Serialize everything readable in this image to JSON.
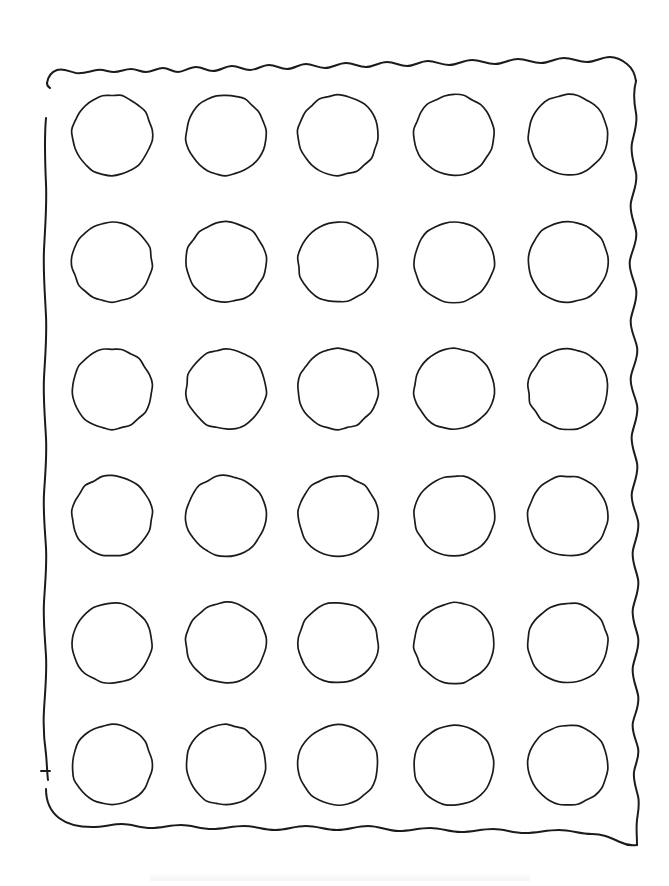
{
  "document": {
    "title": "Hand-drawn circle grid worksheet",
    "medium": "pencil-on-paper-scan",
    "page_width": 669,
    "page_height": 886,
    "background_color": "#ffffff",
    "ink_color": "#1b1b1b"
  },
  "border": {
    "label": "hand-drawn wavy rectangle frame",
    "stroke_color": "#1b1b1b",
    "stroke_width": 2.0,
    "bounds": {
      "left": 44,
      "top": 62,
      "right": 638,
      "bottom": 845
    },
    "style": "wobbly freehand outline with small scalloped bumps along top and bottom, gap near upper-left and mid-left"
  },
  "grid": {
    "label": "circle grid",
    "rows": 6,
    "columns": 5,
    "total_circles": 30,
    "circle_diameter": 80,
    "column_centers": [
      112,
      226,
      338,
      454,
      568
    ],
    "row_centers": [
      135,
      262,
      389,
      516,
      643,
      765
    ],
    "stroke_color": "#1b1b1b",
    "stroke_width": 1.7,
    "fill": "none"
  },
  "chart_data": {
    "type": "scatter",
    "xlabel": "",
    "ylabel": "",
    "categories": [
      "col 1",
      "col 2",
      "col 3",
      "col 4",
      "col 5"
    ],
    "rows": [
      "row 1",
      "row 2",
      "row 3",
      "row 4",
      "row 5",
      "row 6"
    ],
    "xlim": [
      44,
      638
    ],
    "ylim": [
      62,
      845
    ],
    "grid": false,
    "legend": "none",
    "points": [
      {
        "row": 1,
        "col": 1,
        "cx": 112,
        "cy": 135,
        "r": 40
      },
      {
        "row": 1,
        "col": 2,
        "cx": 226,
        "cy": 135,
        "r": 40
      },
      {
        "row": 1,
        "col": 3,
        "cx": 338,
        "cy": 135,
        "r": 40
      },
      {
        "row": 1,
        "col": 4,
        "cx": 454,
        "cy": 135,
        "r": 40
      },
      {
        "row": 1,
        "col": 5,
        "cx": 568,
        "cy": 135,
        "r": 40
      },
      {
        "row": 2,
        "col": 1,
        "cx": 112,
        "cy": 262,
        "r": 40
      },
      {
        "row": 2,
        "col": 2,
        "cx": 226,
        "cy": 262,
        "r": 40
      },
      {
        "row": 2,
        "col": 3,
        "cx": 338,
        "cy": 262,
        "r": 40
      },
      {
        "row": 2,
        "col": 4,
        "cx": 454,
        "cy": 262,
        "r": 40
      },
      {
        "row": 2,
        "col": 5,
        "cx": 568,
        "cy": 262,
        "r": 40
      },
      {
        "row": 3,
        "col": 1,
        "cx": 112,
        "cy": 389,
        "r": 40
      },
      {
        "row": 3,
        "col": 2,
        "cx": 226,
        "cy": 389,
        "r": 40
      },
      {
        "row": 3,
        "col": 3,
        "cx": 338,
        "cy": 389,
        "r": 40
      },
      {
        "row": 3,
        "col": 4,
        "cx": 454,
        "cy": 389,
        "r": 40
      },
      {
        "row": 3,
        "col": 5,
        "cx": 568,
        "cy": 389,
        "r": 40
      },
      {
        "row": 4,
        "col": 1,
        "cx": 112,
        "cy": 516,
        "r": 40
      },
      {
        "row": 4,
        "col": 2,
        "cx": 226,
        "cy": 516,
        "r": 40
      },
      {
        "row": 4,
        "col": 3,
        "cx": 338,
        "cy": 516,
        "r": 40
      },
      {
        "row": 4,
        "col": 4,
        "cx": 454,
        "cy": 516,
        "r": 40
      },
      {
        "row": 4,
        "col": 5,
        "cx": 568,
        "cy": 516,
        "r": 40
      },
      {
        "row": 5,
        "col": 1,
        "cx": 112,
        "cy": 643,
        "r": 40
      },
      {
        "row": 5,
        "col": 2,
        "cx": 226,
        "cy": 643,
        "r": 40
      },
      {
        "row": 5,
        "col": 3,
        "cx": 338,
        "cy": 643,
        "r": 40
      },
      {
        "row": 5,
        "col": 4,
        "cx": 454,
        "cy": 643,
        "r": 40
      },
      {
        "row": 5,
        "col": 5,
        "cx": 568,
        "cy": 643,
        "r": 40
      },
      {
        "row": 6,
        "col": 1,
        "cx": 112,
        "cy": 765,
        "r": 40
      },
      {
        "row": 6,
        "col": 2,
        "cx": 226,
        "cy": 765,
        "r": 40
      },
      {
        "row": 6,
        "col": 3,
        "cx": 338,
        "cy": 765,
        "r": 40
      },
      {
        "row": 6,
        "col": 4,
        "cx": 454,
        "cy": 765,
        "r": 40
      },
      {
        "row": 6,
        "col": 5,
        "cx": 568,
        "cy": 765,
        "r": 40
      }
    ]
  }
}
